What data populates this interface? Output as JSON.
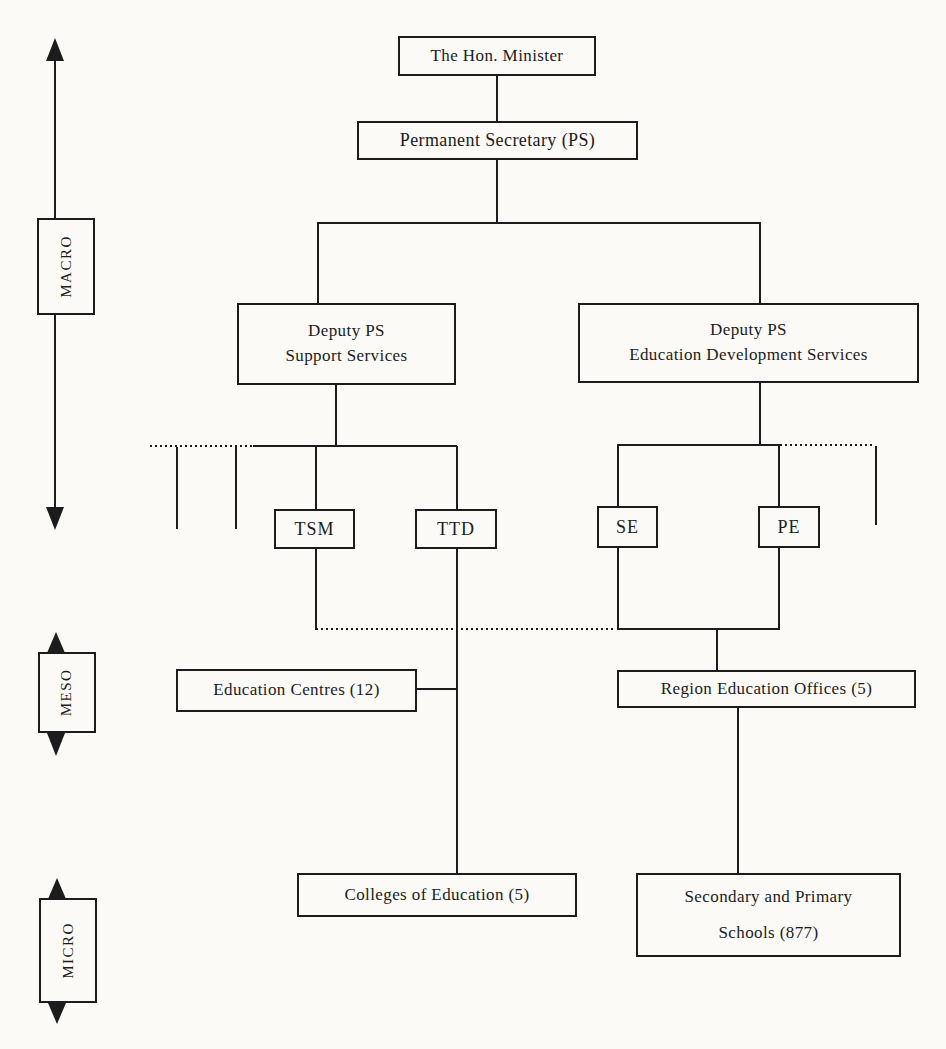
{
  "page": {
    "background_color": "#fbfaf6",
    "ink_color": "#1c1c1c"
  },
  "nodes": {
    "minister": "The Hon. Minister",
    "permanent_secretary": "Permanent Secretary (PS)",
    "deputy_support_line1": "Deputy PS",
    "deputy_support_line2": "Support Services",
    "deputy_education_line1": "Deputy PS",
    "deputy_education_line2": "Education Development Services",
    "tsm": "TSM",
    "ttd": "TTD",
    "se": "SE",
    "pe": "PE",
    "education_centres": "Education Centres (12)",
    "region_offices": "Region Education Offices (5)",
    "colleges": "Colleges of Education (5)",
    "schools_line1": "Secondary and Primary",
    "schools_line2": "Schools (877)"
  },
  "levels": {
    "macro": "MACRO",
    "meso": "MESO",
    "micro": "MICRO"
  }
}
